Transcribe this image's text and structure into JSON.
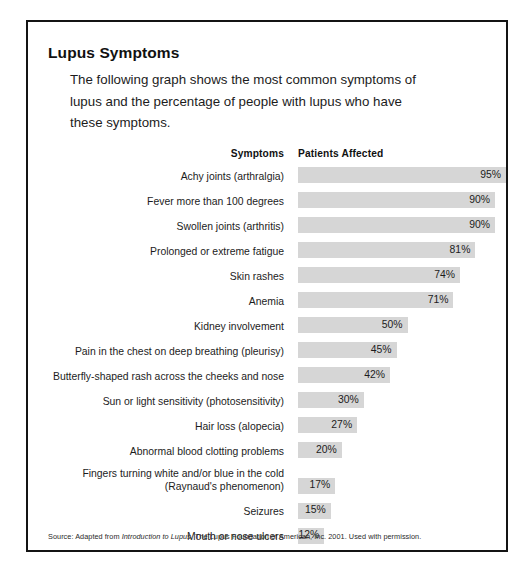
{
  "title": "Lupus Symptoms",
  "intro": {
    "line1": "The following graph shows the most common symptoms of",
    "line2": "lupus and the percentage of people with lupus who have",
    "line3": "these symptoms."
  },
  "columns": {
    "symptoms": "Symptoms",
    "patients_affected": "Patients Affected"
  },
  "source": {
    "prefix": "Source: Adapted from ",
    "italic": "Introduction to Lupus",
    "suffix": ", The Lupus Foundation of American, Inc. 2001. Used with permission."
  },
  "colors": {
    "bar_fill": "#d6d6d6",
    "frame": "#141414",
    "text": "#1c1c1c",
    "page_background": "#ffffff"
  },
  "chart_data": {
    "type": "bar",
    "orientation": "horizontal",
    "title": "Lupus Symptoms",
    "subtitle": "The following graph shows the most common symptoms of lupus and the percentage of people with lupus who have these symptoms.",
    "xlabel": "Patients Affected",
    "ylabel": "Symptoms",
    "xlim": [
      0,
      100
    ],
    "value_unit": "%",
    "grid": false,
    "legend": null,
    "value_labels": true,
    "categories": [
      "Achy joints (arthralgia)",
      "Fever more than 100 degrees",
      "Swollen joints (arthritis)",
      "Prolonged or extreme fatigue",
      "Skin rashes",
      "Anemia",
      "Kidney involvement",
      "Pain in the chest on deep breathing (pleurisy)",
      "Butterfly-shaped rash across the cheeks and nose",
      "Sun or light sensitivity (photosensitivity)",
      "Hair loss (alopecia)",
      "Abnormal blood clotting problems",
      "Fingers turning white and/or blue in the cold (Raynaud's phenomenon)",
      "Seizures",
      "Mouth or nose ulcers"
    ],
    "values": [
      95,
      90,
      90,
      81,
      74,
      71,
      50,
      45,
      42,
      30,
      27,
      20,
      17,
      15,
      12
    ],
    "value_text": [
      "95%",
      "90%",
      "90%",
      "81%",
      "74%",
      "71%",
      "50%",
      "45%",
      "42%",
      "30%",
      "27%",
      "20%",
      "17%",
      "15%",
      "12%"
    ],
    "rows": [
      {
        "label": "Achy joints (arthralgia)",
        "value": 95,
        "value_text": "95%",
        "lines": 1
      },
      {
        "label": "Fever more than 100 degrees",
        "value": 90,
        "value_text": "90%",
        "lines": 1
      },
      {
        "label": "Swollen joints (arthritis)",
        "value": 90,
        "value_text": "90%",
        "lines": 1
      },
      {
        "label": "Prolonged or extreme fatigue",
        "value": 81,
        "value_text": "81%",
        "lines": 1
      },
      {
        "label": "Skin rashes",
        "value": 74,
        "value_text": "74%",
        "lines": 1
      },
      {
        "label": "Anemia",
        "value": 71,
        "value_text": "71%",
        "lines": 1
      },
      {
        "label": "Kidney involvement",
        "value": 50,
        "value_text": "50%",
        "lines": 1
      },
      {
        "label": "Pain in the chest on deep breathing (pleurisy)",
        "value": 45,
        "value_text": "45%",
        "lines": 1
      },
      {
        "label": "Butterfly-shaped rash across the cheeks and nose",
        "value": 42,
        "value_text": "42%",
        "lines": 1
      },
      {
        "label": "Sun or light sensitivity (photosensitivity)",
        "value": 30,
        "value_text": "30%",
        "lines": 1
      },
      {
        "label": "Hair loss (alopecia)",
        "value": 27,
        "value_text": "27%",
        "lines": 1
      },
      {
        "label": "Abnormal blood clotting problems",
        "value": 20,
        "value_text": "20%",
        "lines": 1
      },
      {
        "label": "Fingers turning white and/or blue in the cold\n(Raynaud's phenomenon)",
        "value": 17,
        "value_text": "17%",
        "lines": 2
      },
      {
        "label": "Seizures",
        "value": 15,
        "value_text": "15%",
        "lines": 1
      },
      {
        "label": "Mouth or nose ulcers",
        "value": 12,
        "value_text": "12%",
        "lines": 1
      }
    ]
  }
}
